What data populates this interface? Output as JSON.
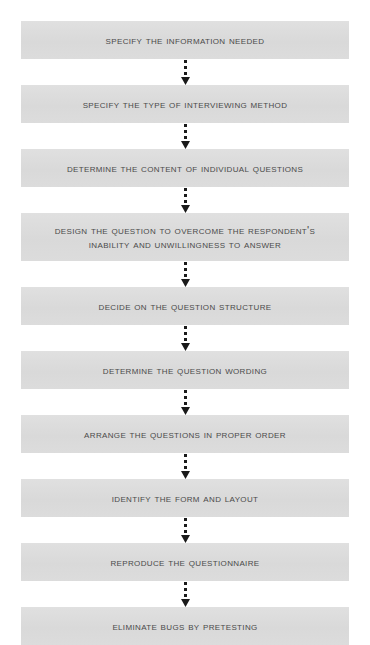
{
  "diagram": {
    "background_color": "#ffffff",
    "box_color": "#dcdcdc",
    "text_color": "#4a4a4a",
    "connector_color": "#1a1a1a",
    "connector_style": "dotted-line-with-solid-triangle-arrowhead",
    "orientation": "vertical-top-to-bottom",
    "step_count": 10,
    "steps": [
      {
        "index": 1,
        "label": "Specify the Information Needed",
        "lines": 1
      },
      {
        "index": 2,
        "label": "Specify the Type of Interviewing Method",
        "lines": 1
      },
      {
        "index": 3,
        "label": "Determine the Content of Individual Questions",
        "lines": 1
      },
      {
        "index": 4,
        "label": "Design the Question to Overcome the Respondent's\nInability and Unwillingness to Answer",
        "lines": 2
      },
      {
        "index": 5,
        "label": "Decide on the Question Structure",
        "lines": 1
      },
      {
        "index": 6,
        "label": "Determine the Question Wording",
        "lines": 1
      },
      {
        "index": 7,
        "label": "Arrange the Questions in Proper Order",
        "lines": 1
      },
      {
        "index": 8,
        "label": "Identify the Form and Layout",
        "lines": 1
      },
      {
        "index": 9,
        "label": "Reproduce the Questionnaire",
        "lines": 1
      },
      {
        "index": 10,
        "label": "Eliminate Bugs by Pretesting",
        "lines": 1
      }
    ]
  }
}
